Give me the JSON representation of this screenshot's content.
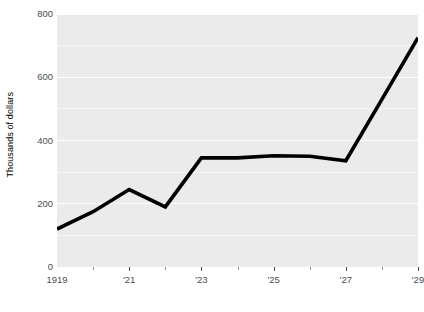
{
  "chart_data": {
    "type": "line",
    "title": "",
    "subtitle": "",
    "xlabel": "",
    "ylabel": "Thousands of dollars",
    "xlim": [
      1919,
      1929
    ],
    "ylim": [
      0,
      800
    ],
    "grid": true,
    "legend": false,
    "legend_position": "none",
    "y_ticks": [
      0,
      200,
      400,
      600,
      800
    ],
    "y_tick_labels": [
      "0",
      "200",
      "400",
      "600",
      "800"
    ],
    "x_ticks": [
      1919,
      1921,
      1923,
      1925,
      1927,
      1929
    ],
    "x_tick_labels": [
      "1919",
      "'21",
      "'23",
      "'25",
      "'27",
      "'29"
    ],
    "x_minor_ticks": [
      1920,
      1922,
      1924,
      1926,
      1928
    ],
    "x": [
      1919,
      1920,
      1921,
      1922,
      1923,
      1924,
      1925,
      1926,
      1927,
      1928,
      1929
    ],
    "values": [
      120,
      175,
      245,
      190,
      345,
      345,
      352,
      350,
      336,
      530,
      725
    ],
    "series": [
      {
        "name": "value",
        "color": "#000000",
        "line_width": 3.6,
        "values": [
          120,
          175,
          245,
          190,
          345,
          345,
          352,
          350,
          336,
          530,
          725
        ]
      }
    ],
    "panel_background": "#ebebeb",
    "gridline_color": "#ffffff",
    "tick_label_color": "#4d4d4d",
    "axis_title_color": "#000000"
  }
}
